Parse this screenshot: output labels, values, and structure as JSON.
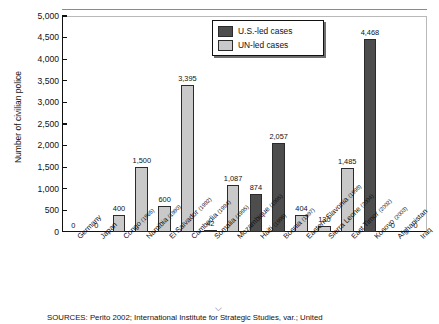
{
  "chart_data": {
    "type": "bar",
    "title": "",
    "xlabel": "",
    "ylabel": "Number of civilian police",
    "ylim": [
      0,
      5000
    ],
    "ytick_labels": [
      "5,000",
      "4,500",
      "4,000",
      "3,500",
      "3,000",
      "2,500",
      "2,000",
      "1,500",
      "1,000",
      "500",
      "0"
    ],
    "ytick_values": [
      5000,
      4500,
      4000,
      3500,
      3000,
      2500,
      2000,
      1500,
      1000,
      500,
      0
    ],
    "grid": false,
    "legend_position": "top-center-right",
    "legend": [
      "U.S.-led cases",
      "UN-led cases"
    ],
    "categories": [
      "Germany",
      "Japan",
      "Congo",
      "Namibia",
      "El Salvador",
      "Cambodia",
      "Somalia",
      "Mozambique",
      "Haiti",
      "Bosnia",
      "Eastern Slavonia",
      "Sierra Leone",
      "East Timor",
      "Kosovo",
      "Afghanistan",
      "Iraq"
    ],
    "category_years": [
      "",
      "",
      "(1965)",
      "(1990)",
      "(1992)",
      "(1994)",
      "(1995)",
      "(1995)",
      "(1996)",
      "(1997)",
      "(1998)",
      "(2004)",
      "(2002)",
      "(2003)",
      "",
      ""
    ],
    "values": [
      0,
      0,
      400,
      1500,
      600,
      3395,
      42,
      1087,
      874,
      2057,
      404,
      130,
      1485,
      4468,
      0,
      0
    ],
    "value_labels": [
      "0",
      "0",
      "400",
      "1,500",
      "600",
      "3,395",
      "42",
      "1,087",
      "874",
      "2,057",
      "404",
      "130",
      "1,485",
      "4,468",
      "0",
      "0"
    ],
    "series_of_bar": [
      "us",
      "us",
      "un",
      "un",
      "un",
      "un",
      "us",
      "un",
      "us",
      "us",
      "un",
      "un",
      "un",
      "us",
      "us",
      "us"
    ],
    "colors": {
      "us_led": "#4d4d4d",
      "un_led": "#c9c9c9",
      "axis": "#111111",
      "background": "#ffffff"
    }
  },
  "legend": {
    "us_label": "U.S.-led cases",
    "un_label": "UN-led cases"
  },
  "axis": {
    "y_title": "Number of civilian police"
  },
  "footer": {
    "source": "SOURCES: Perito 2002; International Institute for Strategic Studies, var.; United",
    "caret": "⌵"
  }
}
